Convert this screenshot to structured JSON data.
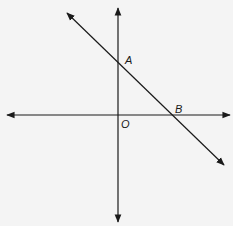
{
  "diagram": {
    "type": "coordinate-plane-with-line",
    "colors": {
      "background": "#f4f4f4",
      "stroke": "#1a1a1a"
    },
    "axes": {
      "x_axis": {
        "y": 115,
        "x1": 7,
        "x2": 230,
        "arrows": "both"
      },
      "y_axis": {
        "x": 118,
        "y1": 8,
        "y2": 222,
        "arrows": "both"
      }
    },
    "line": {
      "x1": 67,
      "y1": 13,
      "x2": 224,
      "y2": 165,
      "arrows": "both"
    },
    "points": [
      {
        "name": "A",
        "label": "A",
        "x": 118,
        "y": 62,
        "label_x": 125,
        "label_y": 64
      },
      {
        "name": "B",
        "label": "B",
        "x": 171,
        "y": 115,
        "label_x": 175,
        "label_y": 113
      },
      {
        "name": "O",
        "label": "O",
        "x": 118,
        "y": 115,
        "label_x": 121,
        "label_y": 128
      }
    ]
  }
}
